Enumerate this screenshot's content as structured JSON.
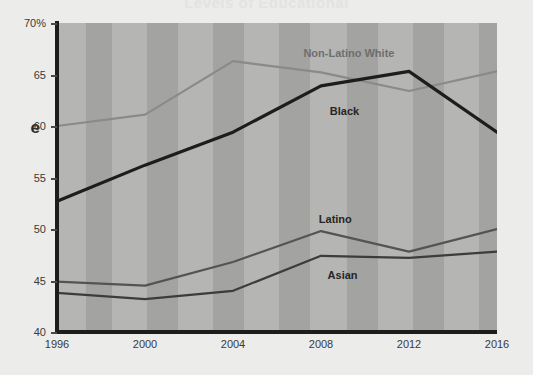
{
  "page": {
    "background_color": "#ececeb",
    "cut_title_fragment": "Levels of Educational",
    "y_axis_title_fragment": "e"
  },
  "chart_data": {
    "type": "line",
    "title": "",
    "xlabel": "",
    "ylabel": "",
    "x": [
      1996,
      2000,
      2004,
      2008,
      2012,
      2016
    ],
    "xtick_labels": [
      "1996",
      "2000",
      "2004",
      "2008",
      "2012",
      "2016"
    ],
    "ytick_labels": [
      "70%",
      "65",
      "60",
      "55",
      "50",
      "45",
      "40"
    ],
    "ytick_values": [
      70,
      65,
      60,
      55,
      50,
      45,
      40
    ],
    "ylim": [
      40,
      70
    ],
    "xlim": [
      1996,
      2016
    ],
    "grid": false,
    "banded_background": true,
    "legend_position": "inline-labels",
    "series": [
      {
        "name": "Non-Latino White",
        "color": "#8a8a8a",
        "values": [
          60.0,
          61.1,
          66.3,
          65.2,
          63.4,
          65.3
        ],
        "label_x": 2007.2,
        "label_y": 67.7
      },
      {
        "name": "Black",
        "color": "#1d1d1d",
        "values": [
          52.7,
          56.2,
          59.4,
          63.9,
          65.3,
          59.4
        ],
        "label_x": 2008.4,
        "label_y": 62.0
      },
      {
        "name": "Latino",
        "color": "#545454",
        "values": [
          44.9,
          44.5,
          46.8,
          49.8,
          47.8,
          50.0
        ],
        "label_x": 2007.9,
        "label_y": 51.6
      },
      {
        "name": "Asian",
        "color": "#3c3c3c",
        "values": [
          43.8,
          43.2,
          44.0,
          47.4,
          47.2,
          47.8
        ],
        "label_x": 2008.3,
        "label_y": 46.1
      }
    ],
    "bands": [
      {
        "start": 1996.0,
        "end": 1997.3,
        "color": "#b5b5b3"
      },
      {
        "start": 1997.3,
        "end": 1998.5,
        "color": "#a3a3a1"
      },
      {
        "start": 1998.5,
        "end": 2000.1,
        "color": "#b5b5b3"
      },
      {
        "start": 2000.1,
        "end": 2001.5,
        "color": "#a3a3a1"
      },
      {
        "start": 2001.5,
        "end": 2003.1,
        "color": "#b5b5b3"
      },
      {
        "start": 2003.1,
        "end": 2004.5,
        "color": "#a3a3a1"
      },
      {
        "start": 2004.5,
        "end": 2006.1,
        "color": "#b5b5b3"
      },
      {
        "start": 2006.1,
        "end": 2007.5,
        "color": "#a3a3a1"
      },
      {
        "start": 2007.5,
        "end": 2009.2,
        "color": "#b5b5b3"
      },
      {
        "start": 2009.2,
        "end": 2010.6,
        "color": "#a3a3a1"
      },
      {
        "start": 2010.6,
        "end": 2012.2,
        "color": "#b5b5b3"
      },
      {
        "start": 2012.2,
        "end": 2013.6,
        "color": "#a3a3a1"
      },
      {
        "start": 2013.6,
        "end": 2015.2,
        "color": "#b5b5b3"
      },
      {
        "start": 2015.2,
        "end": 2016.0,
        "color": "#a3a3a1"
      }
    ]
  }
}
